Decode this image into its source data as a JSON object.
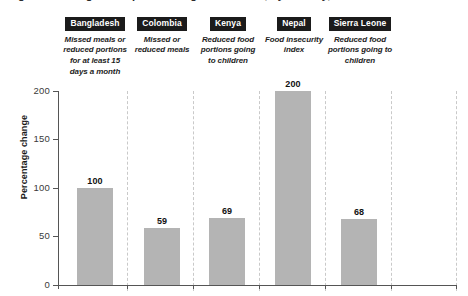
{
  "headline": "Figure 3. Changes in reported hunger indicators, by country, 2020-2021",
  "axis": {
    "ylabel": "Percentage change",
    "yticks": [
      0,
      50,
      100,
      150,
      200
    ],
    "ytick_labels": [
      "0",
      "50",
      "100",
      "150",
      "200"
    ],
    "ymin": 0,
    "ymax": 200
  },
  "columns": [
    {
      "badge": "Bangladesh",
      "subtitle": "Missed meals or reduced portions for at least 15 days a month",
      "value": 100,
      "value_label": "100"
    },
    {
      "badge": "Colombia",
      "subtitle": "Missed or reduced meals",
      "value": 59,
      "value_label": "59"
    },
    {
      "badge": "Kenya",
      "subtitle": "Reduced food portions going to children",
      "value": 69,
      "value_label": "69"
    },
    {
      "badge": "Nepal",
      "subtitle": "Food insecurity index",
      "value": 200,
      "value_label": "200"
    },
    {
      "badge": "Sierra Leone",
      "subtitle": "Reduced food portions going to children",
      "value": 68,
      "value_label": "68"
    }
  ],
  "colors": {
    "bar_fill": "#b4b4b4",
    "badge_bg": "#1b1b1b",
    "badge_text": "#ffffff",
    "axis_line": "#555555",
    "separator": "#c9c9c9",
    "background": "#ffffff"
  },
  "chart_data": {
    "type": "bar",
    "title": "Changes in reported hunger indicators, by country",
    "categories": [
      "Bangladesh",
      "Colombia",
      "Kenya",
      "Nepal",
      "Sierra Leone"
    ],
    "values": [
      100,
      59,
      69,
      200,
      68
    ],
    "data_labels": [
      "100",
      "59",
      "69",
      "200",
      "68"
    ],
    "category_subtitles": [
      "Missed meals or reduced portions for at least 15 days a month",
      "Missed or reduced meals",
      "Reduced food portions going to children",
      "Food insecurity index",
      "Reduced food portions going to children"
    ],
    "xlabel": "",
    "ylabel": "Percentage change",
    "ylim": [
      0,
      200
    ],
    "yticks": [
      0,
      50,
      100,
      150,
      200
    ],
    "grid": false,
    "category_separators": true,
    "legend": false,
    "legend_position": "none",
    "series": [
      {
        "name": "Percentage change",
        "values": [
          100,
          59,
          69,
          200,
          68
        ]
      }
    ]
  }
}
